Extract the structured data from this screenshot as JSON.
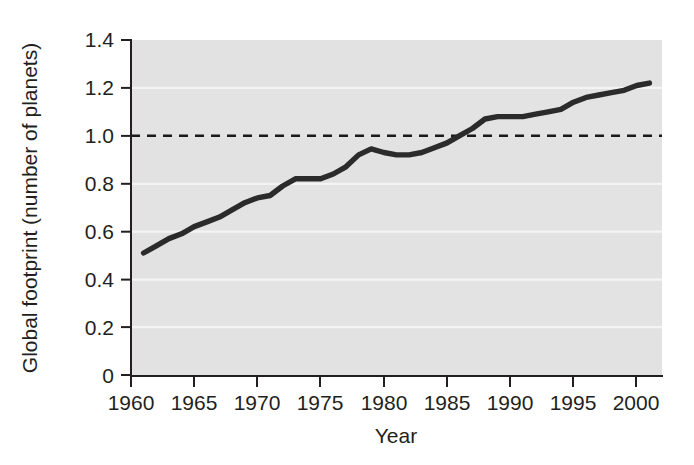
{
  "chart_data": {
    "type": "line",
    "title": "",
    "xlabel": "Year",
    "ylabel": "Global footprint (number of planets)",
    "xlim": [
      1960,
      2002
    ],
    "ylim": [
      0,
      1.4
    ],
    "grid": true,
    "legend": null,
    "xticks": [
      1960,
      1965,
      1970,
      1975,
      1980,
      1985,
      1990,
      1995,
      2000
    ],
    "xtick_labels": [
      "1960",
      "1965",
      "1970",
      "1975",
      "1980",
      "1985",
      "1990",
      "1995",
      "2000"
    ],
    "yticks": [
      0,
      0.2,
      0.4,
      0.6,
      0.8,
      1.0,
      1.2,
      1.4
    ],
    "ytick_labels": [
      "0",
      "0.2",
      "0.4",
      "0.6",
      "0.8",
      "1.0",
      "1.2",
      "1.4"
    ],
    "annotations": [
      {
        "name": "one-planet-reference",
        "type": "hline",
        "y": 1.0,
        "style": "dashed",
        "label": ""
      }
    ],
    "series": [
      {
        "name": "Global footprint",
        "color": "#2b2b2b",
        "x": [
          1961,
          1962,
          1963,
          1964,
          1965,
          1966,
          1967,
          1968,
          1969,
          1970,
          1971,
          1972,
          1973,
          1974,
          1975,
          1976,
          1977,
          1978,
          1979,
          1980,
          1981,
          1982,
          1983,
          1984,
          1985,
          1986,
          1987,
          1988,
          1989,
          1990,
          1991,
          1992,
          1993,
          1994,
          1995,
          1996,
          1997,
          1998,
          1999,
          2000,
          2001
        ],
        "y": [
          0.51,
          0.54,
          0.57,
          0.59,
          0.62,
          0.64,
          0.66,
          0.69,
          0.72,
          0.74,
          0.75,
          0.79,
          0.82,
          0.82,
          0.82,
          0.84,
          0.87,
          0.92,
          0.945,
          0.93,
          0.92,
          0.92,
          0.93,
          0.95,
          0.97,
          1.0,
          1.03,
          1.07,
          1.08,
          1.08,
          1.08,
          1.09,
          1.1,
          1.11,
          1.14,
          1.16,
          1.17,
          1.18,
          1.19,
          1.21,
          1.22
        ]
      }
    ]
  },
  "axes": {
    "y_axis_title": "Global footprint (number of planets)",
    "x_axis_title": "Year"
  },
  "colors": {
    "line": "#2b2b2b",
    "plot_background": "#e3e3e3",
    "gridline": "#f4f4f4",
    "axis": "#231f20"
  }
}
